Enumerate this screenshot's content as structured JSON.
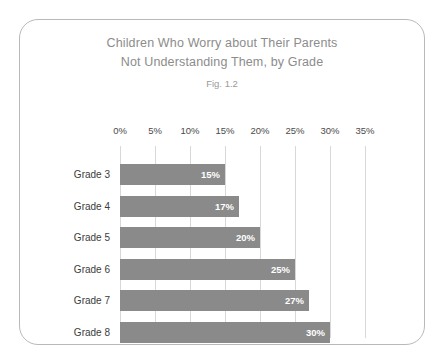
{
  "figure": {
    "title_line_1": "Children Who Worry about Their Parents",
    "title_line_2": "Not Understanding Them, by Grade",
    "subtitle": "Fig. 1.2"
  },
  "colors": {
    "bar": "#8a8a8a",
    "gridline": "#d8d8d8",
    "title_text": "#8c8c8c",
    "category_text": "#3c3c3c",
    "value_text": "#ffffff",
    "card_border": "#b9b9b9",
    "background": "#ffffff"
  },
  "chart_data": {
    "type": "bar",
    "orientation": "horizontal",
    "title": "Children Who Worry about Their Parents Not Understanding Them, by Grade",
    "subtitle": "Fig. 1.2",
    "xlabel": "",
    "ylabel": "",
    "categories": [
      "Grade 3",
      "Grade 4",
      "Grade 5",
      "Grade 6",
      "Grade 7",
      "Grade 8"
    ],
    "values": [
      15,
      17,
      20,
      25,
      27,
      30
    ],
    "value_labels": [
      "15%",
      "17%",
      "20%",
      "25%",
      "27%",
      "30%"
    ],
    "xlim": [
      0,
      35
    ],
    "xticks": [
      0,
      5,
      10,
      15,
      20,
      25,
      30,
      35
    ],
    "xtick_labels": [
      "0%",
      "5%",
      "10%",
      "15%",
      "20%",
      "25%",
      "30%",
      "35%"
    ],
    "grid": "vertical",
    "legend": "none"
  }
}
